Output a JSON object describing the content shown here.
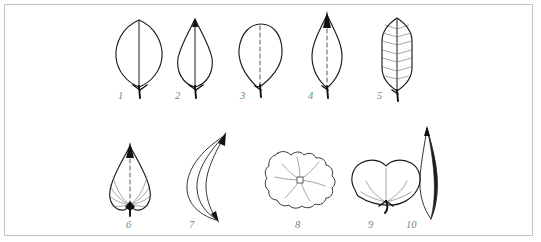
{
  "figure": {
    "border_color": "#b9c6c6",
    "background_color": "#ffffff",
    "ink_color": "#1a1a1a",
    "label_color": "#6e8a88",
    "rows": 2,
    "columns": 5,
    "total_specimens": 10
  },
  "specimens": [
    {
      "number": "1",
      "shape": "elliptic",
      "venation": "midrib-only",
      "row": 1,
      "column": 1
    },
    {
      "number": "2",
      "shape": "ovate",
      "venation": "midrib-only",
      "row": 1,
      "column": 2
    },
    {
      "number": "3",
      "shape": "obovate",
      "venation": "midrib-dashed",
      "row": 1,
      "column": 3
    },
    {
      "number": "4",
      "shape": "rhombic-lanceolate",
      "venation": "midrib-dashed",
      "row": 1,
      "column": 4
    },
    {
      "number": "5",
      "shape": "oblong",
      "venation": "pinnate",
      "row": 1,
      "column": 5
    },
    {
      "number": "6",
      "shape": "cordate",
      "venation": "palmate-arcuate",
      "row": 2,
      "column": 1
    },
    {
      "number": "7",
      "shape": "falcate",
      "venation": "parallel-curved",
      "row": 2,
      "column": 2
    },
    {
      "number": "8",
      "shape": "orbicular-peltate",
      "venation": "radiate",
      "row": 2,
      "column": 3
    },
    {
      "number": "9",
      "shape": "reniform",
      "venation": "palmate",
      "row": 2,
      "column": 4
    },
    {
      "number": "10",
      "shape": "linear-acicular",
      "venation": "midrib-only",
      "row": 2,
      "column": 5
    }
  ],
  "labels": {
    "l1": "1",
    "l2": "2",
    "l3": "3",
    "l4": "4",
    "l5": "5",
    "l6": "6",
    "l7": "7",
    "l8": "8",
    "l9": "9",
    "l10": "10"
  }
}
